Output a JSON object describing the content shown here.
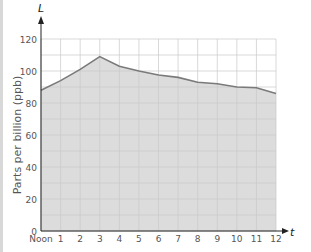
{
  "chart_data": {
    "type": "area",
    "title": "",
    "xlabel": "t",
    "ylabel": "Parts per billion (ppb)",
    "y_axis_letter": "L",
    "x_axis_letter": "t",
    "x": [
      0,
      1,
      2,
      3,
      4,
      5,
      6,
      7,
      8,
      9,
      10,
      11,
      12
    ],
    "x_tick_labels": [
      "Noon",
      "1",
      "2",
      "3",
      "4",
      "5",
      "6",
      "7",
      "8",
      "9",
      "10",
      "11",
      "12"
    ],
    "y_ticks": [
      0,
      20,
      40,
      60,
      80,
      100,
      120
    ],
    "values": [
      88,
      94,
      101,
      109,
      103,
      100,
      97.5,
      96,
      93,
      92,
      90,
      89.5,
      86
    ],
    "xlim": [
      0,
      12
    ],
    "ylim": [
      0,
      120
    ],
    "grid": true,
    "grid_minor_y_step": 10,
    "legend": null
  },
  "colors": {
    "line": "#7a7a7a",
    "fill": "#dcdcdc",
    "grid": "#c9c9c9",
    "axis": "#222222",
    "text": "#555555"
  }
}
